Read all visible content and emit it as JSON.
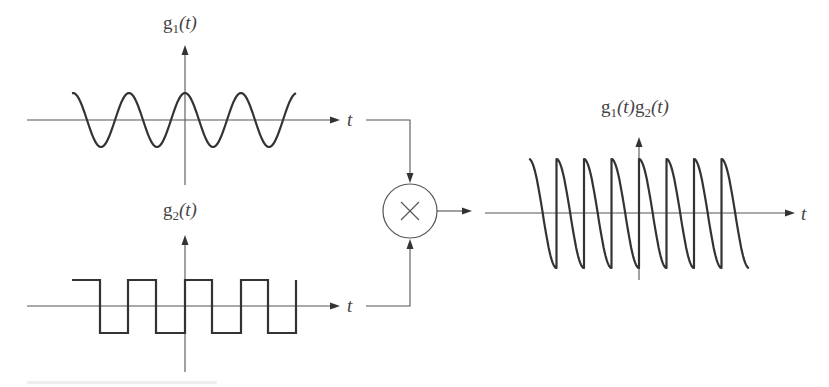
{
  "figure": {
    "caption_visible": false,
    "colors": {
      "ink": "#333333",
      "axis": "#555555",
      "label": "#444444",
      "background": "#ffffff"
    }
  },
  "g1_plot": {
    "label_main": "g",
    "label_sub": "1",
    "label_arg": "(t)",
    "axis_label": "t",
    "waveform": "cosine",
    "periods": 4,
    "origin": [
      185,
      120
    ],
    "x_axis": [
      27,
      340
    ],
    "y_axis": [
      45,
      185
    ],
    "wave_x": [
      72,
      296
    ],
    "amplitude_px": 27,
    "period_px": 56
  },
  "g2_plot": {
    "label_main": "g",
    "label_sub": "2",
    "label_arg": "(t)",
    "axis_label": "t",
    "waveform": "square",
    "origin": [
      185,
      306
    ],
    "x_axis": [
      27,
      340
    ],
    "y_axis": [
      235,
      372
    ],
    "wave_x": [
      72,
      296
    ],
    "high_y": 280,
    "low_y": 333,
    "transitions_x": [
      100,
      128,
      156,
      185,
      212,
      241,
      268,
      296
    ]
  },
  "multiplier": {
    "symbol": "×",
    "center": [
      410,
      211
    ],
    "radius": 27
  },
  "product_plot": {
    "label": "g1(t)g2(t)",
    "label_parts": [
      "g",
      "1",
      "(t)",
      "g",
      "2",
      "(t)"
    ],
    "axis_label": "t",
    "waveform": "cosine × square (sawtooth-like)",
    "origin": [
      639,
      213
    ],
    "x_axis": [
      485,
      795
    ],
    "y_axis": [
      137,
      280
    ],
    "wave_x": [
      529,
      749
    ],
    "segments": 8,
    "segment_px": 27.5,
    "peak_y": 159,
    "trough_y": 268
  },
  "chart_data": {
    "type": "line",
    "title": "",
    "series": [
      {
        "name": "g1(t)",
        "shape": "cosine",
        "amplitude": 1,
        "periods_shown": 4,
        "x_range_periods": [
          -2,
          2
        ]
      },
      {
        "name": "g2(t)",
        "shape": "square wave",
        "levels": [
          -1,
          1
        ],
        "periods_shown": 4,
        "x_range_periods": [
          -2,
          2
        ]
      },
      {
        "name": "g1(t)g2(t)",
        "shape": "product: each half-period a descending cosine segment from +1 to -1 with vertical jumps",
        "segments": 8
      }
    ],
    "xlabel": "t",
    "ylabels": [
      "g1(t)",
      "g2(t)",
      "g1(t)g2(t)"
    ],
    "operator": "multiplication (×)"
  }
}
